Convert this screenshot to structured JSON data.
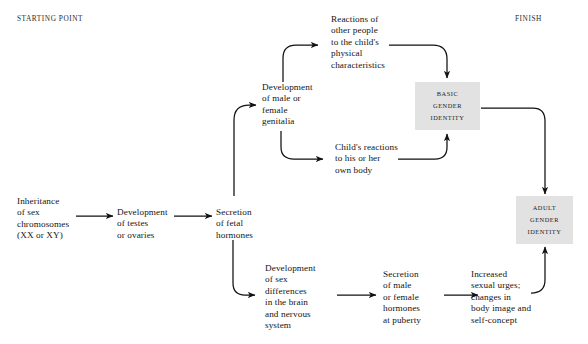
{
  "diagram": {
    "title_hidden": "",
    "corner_labels": {
      "start": "STARTING POINT",
      "finish": "FINISH"
    },
    "colors": {
      "background": "#ffffff",
      "box_fill": "#e2e2e2",
      "line": "#111111",
      "text": "#141414"
    },
    "nodes": [
      {
        "id": "inheritance",
        "label": "Inheritance\nof sex\nchromosomes\n(XX or XY)"
      },
      {
        "id": "testes",
        "label": "Development\nof testes\nor ovaries"
      },
      {
        "id": "fetal-hormones",
        "label": "Secretion\nof fetal\nhormones"
      },
      {
        "id": "genitalia",
        "label": "Development\nof male or\nfemale\ngenitalia"
      },
      {
        "id": "reactions-others",
        "label": "Reactions of\nother people\nto the child's\nphysical\ncharacteristics"
      },
      {
        "id": "childs-reactions",
        "label": "Child's reactions\nto his or her\nown body"
      },
      {
        "id": "sex-differences",
        "label": "Development\nof sex\ndifferences\nin the brain\nand nervous\nsystem"
      },
      {
        "id": "puberty-hormones",
        "label": "Secretion\nof male\nor female\nhormones\nat puberty"
      },
      {
        "id": "sexual-urges",
        "label": "Increased\nsexual urges;\nchanges in\nbody image and\nself-concept"
      }
    ],
    "outcome_boxes": [
      {
        "id": "basic-gender-identity",
        "lines": [
          "BASIC",
          "GENDER",
          "IDENTITY"
        ]
      },
      {
        "id": "adult-gender-identity",
        "lines": [
          "ADULT",
          "GENDER",
          "IDENTITY"
        ]
      }
    ]
  }
}
